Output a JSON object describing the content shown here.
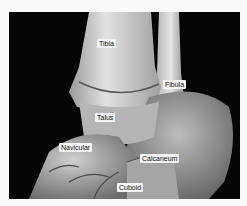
{
  "figure": {
    "labels": [
      {
        "text": "Tibia",
        "x": 97,
        "y": 39
      },
      {
        "text": "Fibula",
        "x": 163,
        "y": 80
      },
      {
        "text": "Talus",
        "x": 95,
        "y": 113
      },
      {
        "text": "Navicular",
        "x": 59,
        "y": 143
      },
      {
        "text": "Calcaneum",
        "x": 140,
        "y": 154
      },
      {
        "text": "Cuboid",
        "x": 117,
        "y": 183
      }
    ],
    "colors": {
      "background": "#050505",
      "bone_light": "#d8d8d8",
      "bone_mid": "#a8a8a8",
      "bone_dark": "#5a5a5a",
      "label_bg": "#f4f4f4",
      "page_bg": "#fafafa"
    }
  }
}
